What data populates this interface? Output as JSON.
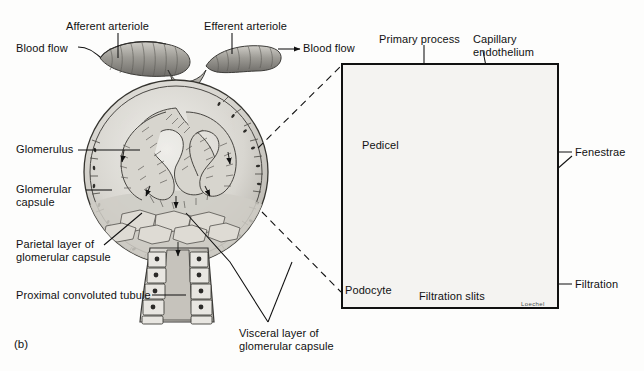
{
  "figure": {
    "panel_label": "(b)",
    "signature": "Loechel",
    "ink_color": "#111111",
    "paper_color": "#fdfdfc",
    "capillary_fill": "#8e8e8e",
    "tissue_light": "#d9d7d2"
  },
  "labels": {
    "afferent_arteriole": "Afferent arteriole",
    "efferent_arteriole": "Efferent arteriole",
    "blood_flow_left": "Blood flow",
    "blood_flow_right": "Blood flow",
    "glomerulus": "Glomerulus",
    "glomerular_capsule_line1": "Glomerular",
    "glomerular_capsule_line2": "capsule",
    "parietal_layer_line1": "Parietal layer of",
    "parietal_layer_line2": "glomerular capsule",
    "proximal_convoluted_tubule": "Proximal convoluted tubule",
    "visceral_layer_line1": "Visceral layer of",
    "visceral_layer_line2": "glomerular capsule",
    "primary_process": "Primary process",
    "capillary_endothelium_line1": "Capillary",
    "capillary_endothelium_line2": "endothelium",
    "pedicel": "Pedicel",
    "fenestrae": "Fenestrae",
    "podocyte": "Podocyte",
    "filtration_slits": "Filtration slits",
    "filtration": "Filtration"
  }
}
